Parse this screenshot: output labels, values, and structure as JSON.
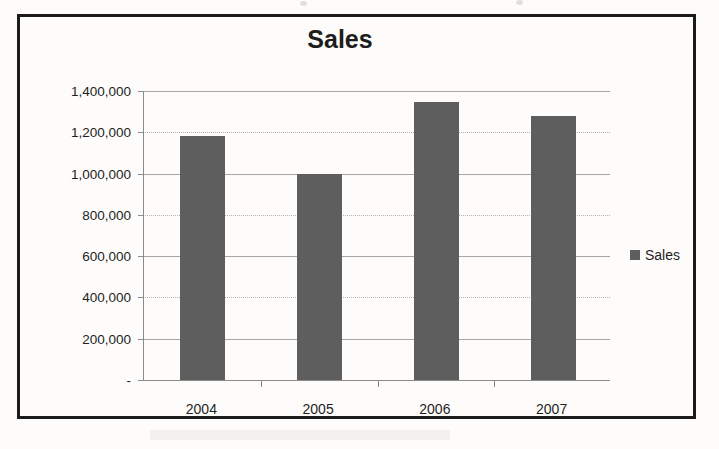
{
  "chart_data": {
    "type": "bar",
    "title": "Sales",
    "xlabel": "",
    "ylabel": "",
    "categories": [
      "2004",
      "2005",
      "2006",
      "2007"
    ],
    "values": [
      1180000,
      1000000,
      1345000,
      1280000
    ],
    "series": [
      {
        "name": "Sales",
        "values": [
          1180000,
          1000000,
          1345000,
          1280000
        ]
      }
    ],
    "ylim": [
      0,
      1400000
    ],
    "ytick_values": [
      1400000,
      1200000,
      1000000,
      800000,
      600000,
      400000,
      200000,
      0
    ],
    "ytick_labels": [
      "1,400,000",
      "1,200,000",
      "1,000,000",
      "800,000",
      "600,000",
      "400,000",
      "200,000",
      "-"
    ],
    "grid": true,
    "legend_position": "right",
    "legend_entries": [
      "Sales"
    ],
    "bar_color": "#5e5e5e",
    "gridline_color": "#a9a7a3",
    "axis_color": "#8d8b87",
    "frame_color": "#1b1b1b",
    "background_color": "#fdfcfa"
  },
  "legend": {
    "swatch_name": "legend-color-swatch",
    "label": "Sales"
  }
}
